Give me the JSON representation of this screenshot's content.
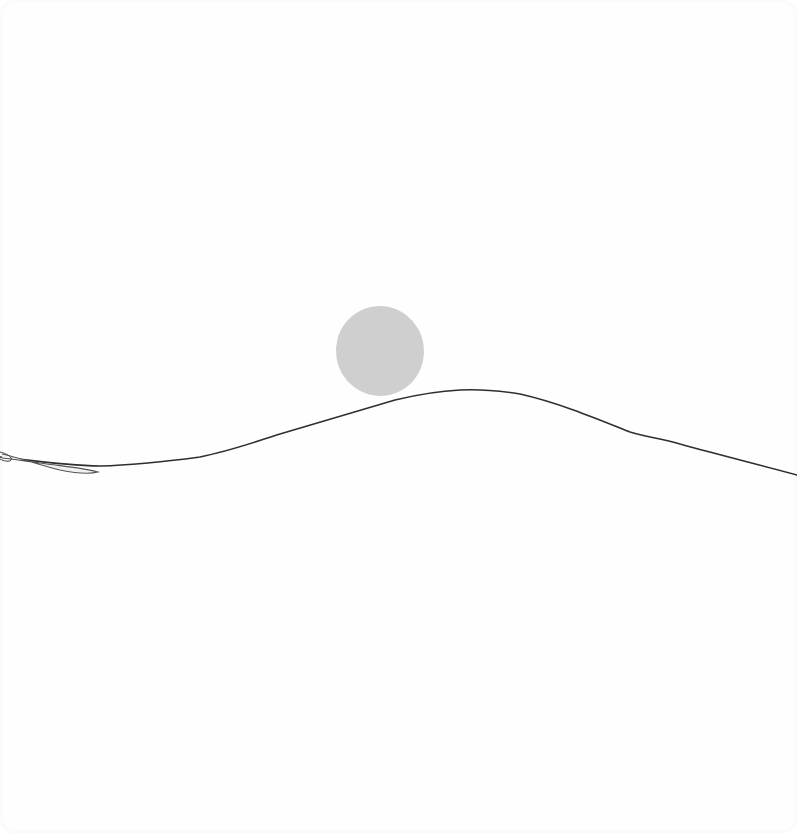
{
  "scene": {
    "description": "Minimalist hand-drawn sketch of a sun/moon above a rolling hill line",
    "colors": {
      "background": "#fefefe",
      "orb_fill": "#cfcfcf",
      "line_stroke": "#2e2e2e",
      "leaf_stroke": "#555555"
    },
    "orb": {
      "cx": 380,
      "cy": 351,
      "rx": 44,
      "ry": 45
    },
    "hill_points": [
      [
        0,
        457
      ],
      [
        40,
        462
      ],
      [
        100,
        466
      ],
      [
        140,
        464
      ],
      [
        180,
        460
      ],
      [
        230,
        450
      ],
      [
        270,
        437
      ],
      [
        320,
        423
      ],
      [
        360,
        412
      ],
      [
        395,
        400
      ],
      [
        440,
        392
      ],
      [
        470,
        390
      ],
      [
        495,
        391
      ],
      [
        530,
        397
      ],
      [
        580,
        412
      ],
      [
        630,
        432
      ],
      [
        670,
        441
      ],
      [
        720,
        454
      ],
      [
        760,
        464
      ],
      [
        797,
        475
      ]
    ]
  }
}
